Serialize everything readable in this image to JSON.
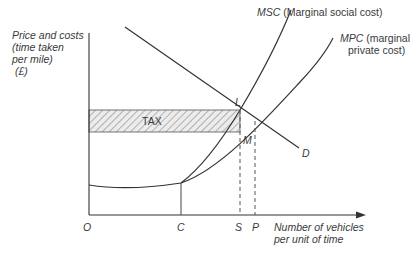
{
  "diagram": {
    "type": "economics-externality-tax",
    "y_axis_label": [
      "Price and costs",
      "(time taken",
      "per mile)",
      " (£)"
    ],
    "x_axis_label": [
      "Number of vehicles",
      "per unit of time"
    ],
    "origin_label": "O",
    "x_ticks": [
      {
        "label": "C",
        "x": 181
      },
      {
        "label": "S",
        "x": 240
      },
      {
        "label": "P",
        "x": 255
      }
    ],
    "curves": {
      "msc": {
        "abbr": "MSC",
        "desc": " (Marginal social cost)"
      },
      "mpc": {
        "abbr": "MPC",
        "desc_line1": " (marginal",
        "desc_line2": "private cost)"
      },
      "demand": {
        "label": "D"
      }
    },
    "points": {
      "L": "L",
      "M": "M"
    },
    "tax_area_label": "TAX",
    "colors": {
      "line": "#333333",
      "hatch": "#666666",
      "hatch_fill": "#e8e8e8",
      "text": "#3a3a3a"
    }
  }
}
